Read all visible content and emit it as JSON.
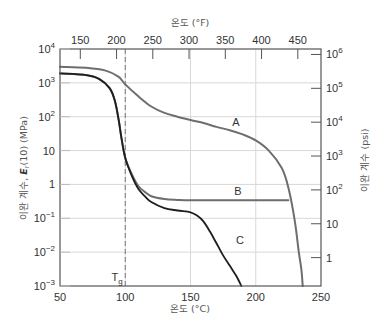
{
  "chart_data": {
    "type": "line",
    "title": "",
    "xlabel": "온도 (°C)",
    "xlabel_top": "온도 (°F)",
    "ylabel": "이완 계수, E_r(10) (MPa)",
    "ylabel_right": "이완 계수 (psi)",
    "x_scale": "linear",
    "y_scale": "log",
    "xlim": [
      50,
      250
    ],
    "ylim": [
      0.001,
      10000
    ],
    "grid": true,
    "x_ticks": [
      "50",
      "100",
      "150",
      "200",
      "250"
    ],
    "x_ticks_top": [
      "150",
      "200",
      "250",
      "300",
      "350",
      "400",
      "450"
    ],
    "y_ticks": [
      "10^-3",
      "10^-2",
      "10^-1",
      "1",
      "10",
      "10^2",
      "10^3",
      "10^4"
    ],
    "y_ticks_right": [
      "1",
      "10",
      "10^2",
      "10^3",
      "10^4",
      "10^5",
      "10^6"
    ],
    "annotations": [
      {
        "text": "Tg",
        "x": 100,
        "type": "vertical-dashed-line"
      },
      {
        "text": "A",
        "x": 162,
        "y": 35
      },
      {
        "text": "B",
        "x": 162,
        "y": 0.6
      },
      {
        "text": "C",
        "x": 165,
        "y": 0.022
      }
    ],
    "series": [
      {
        "name": "A",
        "color": "#6e6e6e",
        "x": [
          50,
          70,
          85,
          95,
          100,
          110,
          120,
          130,
          140,
          150,
          160,
          170,
          180,
          190,
          200,
          210,
          220,
          225,
          230,
          233,
          235,
          236
        ],
        "y": [
          3000,
          2800,
          2300,
          1500,
          900,
          400,
          200,
          130,
          100,
          80,
          65,
          50,
          40,
          30,
          20,
          10,
          3,
          0.8,
          0.08,
          0.01,
          0.003,
          0.001
        ]
      },
      {
        "name": "B",
        "color": "#6e6e6e",
        "x": [
          50,
          70,
          80,
          88,
          92,
          95,
          97,
          100,
          105,
          110,
          115,
          120,
          130,
          140,
          150,
          175,
          200,
          225
        ],
        "y": [
          1900,
          1700,
          1300,
          700,
          300,
          80,
          25,
          6,
          2,
          0.9,
          0.6,
          0.45,
          0.37,
          0.35,
          0.34,
          0.34,
          0.34,
          0.34
        ]
      },
      {
        "name": "C",
        "color": "#1e1e1e",
        "x": [
          50,
          70,
          80,
          88,
          92,
          95,
          97,
          100,
          105,
          110,
          115,
          120,
          130,
          140,
          150,
          155,
          160,
          165,
          170,
          175,
          180,
          185,
          188,
          189
        ],
        "y": [
          1900,
          1700,
          1300,
          700,
          300,
          80,
          25,
          6,
          1.8,
          0.75,
          0.45,
          0.3,
          0.2,
          0.17,
          0.15,
          0.12,
          0.08,
          0.04,
          0.018,
          0.008,
          0.004,
          0.002,
          0.0012,
          0.001
        ]
      }
    ]
  },
  "labels": {
    "x_title": "온도 (°C)",
    "x_top_title": "온도 (°F)",
    "y_left_title": "이완 계수, ",
    "y_left_symbol": "E",
    "y_left_sub": "r",
    "y_left_rest": "(10) (MPa)",
    "y_right_title": "이완 계수 (psi)",
    "tg_label": "T",
    "tg_sub": "g",
    "curve_a": "A",
    "curve_b": "B",
    "curve_c": "C"
  }
}
